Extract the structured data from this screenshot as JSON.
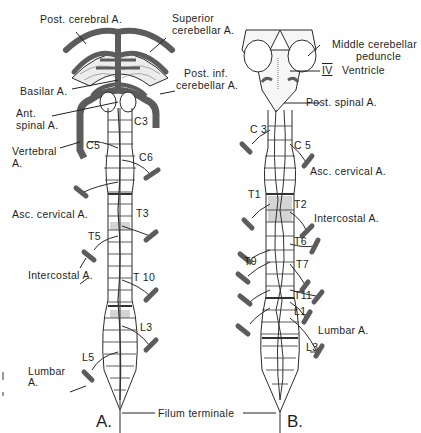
{
  "figure": {
    "panel_a_letter": "A.",
    "panel_b_letter": "B.",
    "shared_label": "Filum terminale",
    "colors": {
      "artery": "#5c5c5c",
      "line": "#2a2a2a",
      "shade": "#d4d4d4",
      "background": "#ffffff"
    }
  },
  "panel_a": {
    "labels": {
      "post_cerebral": "Post. cerebral A.",
      "superior_cerebellar_1": "Superior",
      "superior_cerebellar_2": "cerebellar A.",
      "post_inf_cerebellar_1": "Post. inf.",
      "post_inf_cerebellar_2": "cerebellar A.",
      "basilar": "Basilar A.",
      "ant_spinal_1": "Ant.",
      "ant_spinal_2": "spinal A.",
      "vertebral_1": "Vertebral",
      "vertebral_2": "A.",
      "asc_cervical": "Asc. cervical A.",
      "intercostal": "Intercostal A.",
      "lumbar_1": "Lumbar",
      "lumbar_2": "A."
    },
    "segments": {
      "c3": "C3",
      "c5": "C5",
      "c6": "C6",
      "t3": "T3",
      "t5": "T5",
      "t10": "T 10",
      "l3": "L3",
      "l5": "L5"
    }
  },
  "panel_b": {
    "labels": {
      "middle_cerebellar_1": "Middle cerebellar",
      "middle_cerebellar_2": "peduncle",
      "ventricle_numeral": "IV",
      "ventricle": "Ventricle",
      "post_spinal": "Post. spinal A.",
      "asc_cervical": "Asc. cervical A.",
      "intercostal": "Intercostal A.",
      "lumbar": "Lumbar A."
    },
    "segments": {
      "c3": "C 3",
      "c5": "C 5",
      "t1": "T1",
      "t2": "T2",
      "t6": "T6",
      "t7": "T7",
      "t9": "T9",
      "t11": "T11",
      "l1": "L1",
      "l3": "L3"
    }
  }
}
